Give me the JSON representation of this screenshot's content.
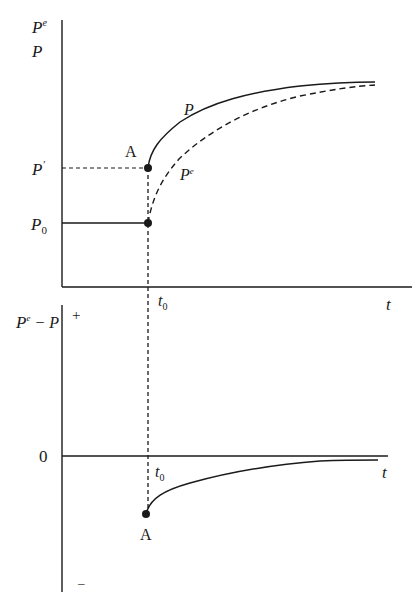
{
  "diagram": {
    "type": "economics adaptive expectations diagram",
    "top_panel": {
      "y_axis_labels": [
        "Pe",
        "P"
      ],
      "x_axis_label": "t",
      "tick_labels": {
        "p_prime": "P′",
        "p0": "P0",
        "t0": "t0"
      },
      "point_label": "A",
      "curve_labels": {
        "actual": "P",
        "expected": "Pe"
      }
    },
    "bottom_panel": {
      "y_axis_label": "Pe − P",
      "plus_sign": "+",
      "minus_sign": "–",
      "zero_label": "0",
      "x_axis_label": "t",
      "t0_label": "t0",
      "point_label": "A"
    }
  },
  "text": {
    "top_y1_base": "P",
    "top_y1_sup": "e",
    "top_y2": "P",
    "pprime_base": "P",
    "pprime_sup": "′",
    "p0_base": "P",
    "p0_sub": "0",
    "A_top": "A",
    "curve_P": "P",
    "curve_Pe_base": "P",
    "curve_Pe_sup": "e",
    "t_top": "t",
    "t0_top_base": "t",
    "t0_top_sub": "0",
    "bot_y_base": "P",
    "bot_y_sup": "e",
    "bot_y_rest": " − P",
    "plus": "+",
    "minus": "–",
    "zero": "0",
    "t0_bot_base": "t",
    "t0_bot_sub": "0",
    "t_bot": "t",
    "A_bot": "A"
  },
  "colors": {
    "ink": "#1a1a1a",
    "background": "#ffffff"
  }
}
